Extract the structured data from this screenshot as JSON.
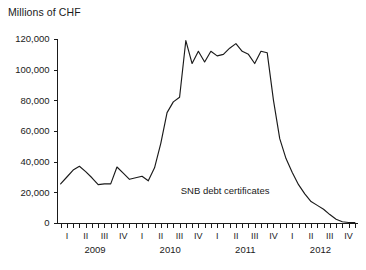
{
  "chart_data": {
    "type": "line",
    "title": "",
    "ylabel": "Millions of CHF",
    "xlabel": "",
    "ylim": [
      0,
      120000
    ],
    "yticks": [
      0,
      20000,
      40000,
      60000,
      80000,
      100000,
      120000
    ],
    "ytick_labels": [
      "0",
      "20,000",
      "40,000",
      "60,000",
      "80,000",
      "100,000",
      "120,000"
    ],
    "grid": false,
    "legend_position": "inline-annotation",
    "quarter_labels": [
      "I",
      "II",
      "III",
      "IV"
    ],
    "year_labels": [
      "2009",
      "2010",
      "2011",
      "2012"
    ],
    "minor_ticks_per_quarter": 3,
    "series": [
      {
        "name": "SNB debt certificates",
        "color": "#1a1a1a",
        "x": [
          "2009-01",
          "2009-02",
          "2009-03",
          "2009-04",
          "2009-05",
          "2009-06",
          "2009-07",
          "2009-08",
          "2009-09",
          "2009-10",
          "2009-11",
          "2009-12",
          "2010-01",
          "2010-02",
          "2010-03",
          "2010-04",
          "2010-05",
          "2010-06",
          "2010-07",
          "2010-08",
          "2010-09",
          "2010-10",
          "2010-11",
          "2010-12",
          "2011-01",
          "2011-02",
          "2011-03",
          "2011-04",
          "2011-05",
          "2011-06",
          "2011-07",
          "2011-08",
          "2011-09",
          "2011-10",
          "2011-11",
          "2011-12",
          "2012-01",
          "2012-02",
          "2012-03",
          "2012-04",
          "2012-05",
          "2012-06",
          "2012-07",
          "2012-08",
          "2012-09",
          "2012-10",
          "2012-11",
          "2012-12"
        ],
        "values": [
          25500,
          30000,
          34500,
          37000,
          33500,
          29500,
          25000,
          25500,
          25500,
          36500,
          32500,
          28500,
          29500,
          30500,
          27500,
          36000,
          52000,
          72000,
          79000,
          82000,
          119000,
          104000,
          112000,
          105000,
          112000,
          109000,
          110000,
          114000,
          117000,
          112000,
          110000,
          104000,
          112000,
          111000,
          80000,
          55000,
          42000,
          33000,
          25000,
          19000,
          14000,
          11500,
          9000,
          5500,
          2500,
          800,
          300,
          200
        ]
      }
    ],
    "annotations": [
      {
        "text": "SNB debt certificates",
        "x_frac": 0.41,
        "y_value": 19000
      }
    ]
  }
}
